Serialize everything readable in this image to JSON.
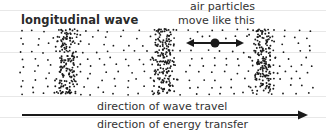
{
  "diagram": {
    "title": "longitudinal wave",
    "annotation": {
      "line1": "air particles",
      "line2": "move like this",
      "icon": "double-headed-arrow-with-particle"
    },
    "arrow": {
      "label_top": "direction of wave travel",
      "label_bottom": "direction of energy transfer",
      "icon": "right-arrow"
    },
    "compressions": [
      {
        "x": 68
      },
      {
        "x": 164
      },
      {
        "x": 263
      }
    ],
    "colors": {
      "dots": "#1a1a1a",
      "text": "#333333",
      "ruled_lines": "#e8e8e8"
    }
  }
}
